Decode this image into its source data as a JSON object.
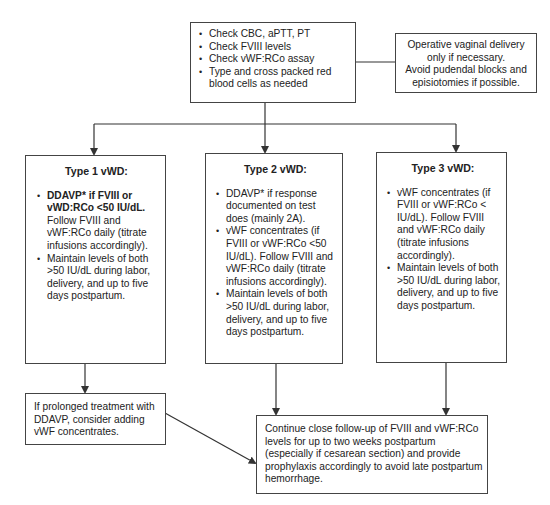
{
  "initial_checks": {
    "items": [
      "Check CBC, aPTT, PT",
      "Check FVIII levels",
      "Check vWF:RCo assay",
      "Type and cross packed red blood cells as needed"
    ]
  },
  "delivery_note": {
    "lines": [
      "Operative vaginal delivery",
      "only if necessary.",
      "Avoid pudendal blocks and",
      "episiotomies if possible."
    ]
  },
  "type1": {
    "title": "Type 1 vWD:",
    "items": [
      {
        "bold": "DDAVP* if FVIII or vWD:RCo <50 IU/dL.",
        "text": " Follow FVIII and vWF:RCo daily (titrate infusions accordingly)."
      },
      {
        "bold": "",
        "text": "Maintain levels of both >50 IU/dL during labor, delivery, and up to five days postpartum."
      }
    ]
  },
  "type2": {
    "title": "Type 2 vWD:",
    "items": [
      "DDAVP* if response documented on test does (mainly 2A).",
      "vWF concentrates (if FVIII or vWF:RCo <50 IU/dL). Follow FVIII and vWF:RCo daily (titrate infusions accordingly).",
      "Maintain levels of both >50 IU/dL during labor, delivery, and up to five days postpartum."
    ]
  },
  "type3": {
    "title": "Type 3 vWD:",
    "items": [
      "vWF concentrates (if FVIII or vWF:RCo < IU/dL). Follow FVIII and vWF:RCo daily (titrate infusions accordingly).",
      "Maintain levels of both >50 IU/dL during labor, delivery, and up to five days postpartum."
    ]
  },
  "ddavp_note": {
    "text": "If prolonged treatment with DDAVP, consider adding vWF concentrates."
  },
  "followup": {
    "text": "Continue close follow-up of FVIII and vWF:RCo levels for up to two weeks postpartum (especially if cesarean section) and provide prophylaxis accordingly to avoid late postpartum hemorrhage."
  },
  "colors": {
    "line": "#333333",
    "border": "#444444"
  }
}
